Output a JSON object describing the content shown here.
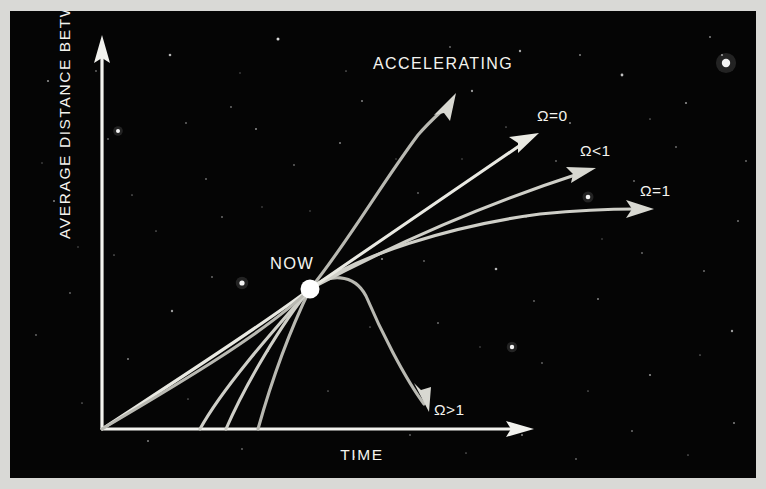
{
  "figure": {
    "alt_title": "Average Distance Between Galaxies versus Time",
    "background_color": "#050505",
    "border_color": "#d9d9d6",
    "ink_color": "#f2f2ee"
  },
  "axes": {
    "y_label": "AVERAGE DISTANCE BETWEEN GALAXIES",
    "x_label": "TIME",
    "y_arrow_direction": "up",
    "x_arrow_direction": "right",
    "ticks": [],
    "grid": false
  },
  "markers": {
    "now_label": "NOW",
    "now_point": [
      300,
      278
    ]
  },
  "labels": {
    "accelerating": "ACCELERATING",
    "omega_zero": "Ω=0",
    "omega_less_than_one": "Ω<1",
    "omega_equal_one": "Ω=1",
    "omega_greater_than_one": "Ω>1"
  },
  "chart_data": {
    "type": "line",
    "xlabel": "TIME",
    "ylabel": "AVERAGE DISTANCE BETWEEN GALAXIES",
    "xlim": [
      0,
      520
    ],
    "ylim": [
      0,
      420
    ],
    "grid": false,
    "legend_position": "inline-end-of-curve",
    "annotations": [
      {
        "text": "NOW",
        "x": 300,
        "y": 278,
        "marker": "filled-circle"
      },
      {
        "text": "ACCELERATING",
        "x": 433,
        "y": 62
      }
    ],
    "series": [
      {
        "name": "ACCELERATING",
        "label": "ACCELERATING",
        "style": "curve-up-concave",
        "start": [
          92,
          418
        ],
        "end": [
          443,
          88
        ],
        "points": [
          [
            92,
            418
          ],
          [
            180,
            370
          ],
          [
            250,
            322
          ],
          [
            300,
            278
          ],
          [
            340,
            215
          ],
          [
            375,
            160
          ],
          [
            412,
            118
          ],
          [
            443,
            88
          ]
        ],
        "arrow": true,
        "description": "Accelerating expansion: distance grows ever faster after NOW"
      },
      {
        "name": "omega_zero",
        "label": "Ω=0",
        "style": "straight-after-now",
        "start": [
          92,
          418
        ],
        "end": [
          527,
          124
        ],
        "points": [
          [
            92,
            418
          ],
          [
            180,
            360
          ],
          [
            250,
            315
          ],
          [
            300,
            278
          ],
          [
            380,
            222
          ],
          [
            460,
            168
          ],
          [
            527,
            124
          ]
        ],
        "arrow": true,
        "description": "Empty universe, coasting expansion, constant rate"
      },
      {
        "name": "omega_less_than_one",
        "label": "Ω<1",
        "style": "open-universe",
        "start": [
          190,
          418
        ],
        "end": [
          585,
          159
        ],
        "points": [
          [
            190,
            418
          ],
          [
            235,
            362
          ],
          [
            270,
            318
          ],
          [
            300,
            278
          ],
          [
            380,
            233
          ],
          [
            480,
            191
          ],
          [
            585,
            159
          ]
        ],
        "arrow": true,
        "description": "Open universe, expands forever at slowly decreasing rate"
      },
      {
        "name": "omega_equal_one",
        "label": "Ω=1",
        "style": "flat-universe",
        "start": [
          216,
          418
        ],
        "end": [
          641,
          198
        ],
        "points": [
          [
            216,
            418
          ],
          [
            250,
            360
          ],
          [
            278,
            315
          ],
          [
            300,
            278
          ],
          [
            370,
            243
          ],
          [
            470,
            217
          ],
          [
            560,
            204
          ],
          [
            641,
            198
          ]
        ],
        "arrow": true,
        "description": "Critical density, flat universe, expansion slows toward zero"
      },
      {
        "name": "omega_greater_than_one",
        "label": "Ω>1",
        "style": "closed-universe",
        "start": [
          248,
          418
        ],
        "end": [
          418,
          397
        ],
        "points": [
          [
            248,
            418
          ],
          [
            268,
            355
          ],
          [
            285,
            310
          ],
          [
            300,
            278
          ],
          [
            332,
            268
          ],
          [
            356,
            283
          ],
          [
            380,
            322
          ],
          [
            402,
            365
          ],
          [
            418,
            397
          ]
        ],
        "arrow": true,
        "description": "Closed universe, expansion halts and recollapses"
      }
    ]
  },
  "stars": [
    [
      38,
      70,
      1.1,
      0.55
    ],
    [
      98,
      128,
      0.9,
      0.4
    ],
    [
      160,
      44,
      1.3,
      0.7
    ],
    [
      221,
      96,
      0.9,
      0.45
    ],
    [
      268,
      28,
      1.5,
      0.85
    ],
    [
      330,
      132,
      1.0,
      0.5
    ],
    [
      392,
      56,
      1.1,
      0.6
    ],
    [
      452,
      148,
      0.8,
      0.35
    ],
    [
      510,
      40,
      1.2,
      0.65
    ],
    [
      560,
      112,
      1.0,
      0.5
    ],
    [
      612,
      64,
      1.4,
      0.75
    ],
    [
      666,
      136,
      0.9,
      0.45
    ],
    [
      712,
      44,
      1.1,
      0.55
    ],
    [
      44,
      190,
      1.0,
      0.5
    ],
    [
      104,
      244,
      0.85,
      0.4
    ],
    [
      162,
      300,
      1.2,
      0.6
    ],
    [
      212,
      206,
      0.9,
      0.45
    ],
    [
      258,
      340,
      1.0,
      0.5
    ],
    [
      318,
      380,
      0.85,
      0.4
    ],
    [
      372,
      248,
      1.1,
      0.55
    ],
    [
      428,
      312,
      0.95,
      0.45
    ],
    [
      486,
      258,
      1.3,
      0.7
    ],
    [
      532,
      352,
      0.9,
      0.4
    ],
    [
      588,
      288,
      1.0,
      0.5
    ],
    [
      640,
      364,
      1.1,
      0.55
    ],
    [
      694,
      260,
      0.95,
      0.45
    ],
    [
      722,
      320,
      1.2,
      0.6
    ],
    [
      72,
      392,
      0.85,
      0.4
    ],
    [
      138,
      430,
      1.0,
      0.5
    ],
    [
      196,
      168,
      0.9,
      0.45
    ],
    [
      246,
      118,
      1.05,
      0.52
    ],
    [
      300,
      200,
      0.8,
      0.35
    ],
    [
      352,
      90,
      1.0,
      0.5
    ],
    [
      408,
      182,
      0.9,
      0.42
    ],
    [
      462,
      80,
      1.15,
      0.6
    ],
    [
      516,
      206,
      0.85,
      0.4
    ],
    [
      570,
      44,
      1.0,
      0.5
    ],
    [
      624,
      170,
      0.9,
      0.45
    ],
    [
      676,
      92,
      1.1,
      0.55
    ],
    [
      728,
      210,
      0.95,
      0.48
    ],
    [
      60,
      282,
      0.9,
      0.42
    ],
    [
      118,
      348,
      1.0,
      0.5
    ],
    [
      178,
      388,
      0.85,
      0.38
    ],
    [
      232,
      438,
      0.9,
      0.42
    ],
    [
      290,
      418,
      0.8,
      0.35
    ],
    [
      344,
      446,
      1.0,
      0.48
    ],
    [
      400,
      424,
      0.9,
      0.4
    ],
    [
      456,
      442,
      0.85,
      0.38
    ],
    [
      512,
      424,
      1.0,
      0.5
    ],
    [
      566,
      448,
      0.9,
      0.42
    ],
    [
      622,
      420,
      0.95,
      0.45
    ],
    [
      678,
      444,
      0.85,
      0.38
    ],
    [
      724,
      412,
      1.0,
      0.5
    ],
    [
      32,
      152,
      0.8,
      0.35
    ],
    [
      86,
      60,
      0.9,
      0.42
    ],
    [
      146,
      220,
      0.85,
      0.4
    ],
    [
      202,
      266,
      0.9,
      0.44
    ],
    [
      252,
      196,
      0.8,
      0.35
    ],
    [
      360,
      316,
      0.85,
      0.38
    ],
    [
      414,
      250,
      0.9,
      0.42
    ],
    [
      470,
      336,
      0.8,
      0.35
    ],
    [
      524,
      290,
      0.9,
      0.42
    ],
    [
      578,
      380,
      0.85,
      0.38
    ],
    [
      632,
      242,
      0.9,
      0.44
    ],
    [
      690,
      344,
      0.85,
      0.4
    ],
    [
      736,
      150,
      0.9,
      0.45
    ],
    [
      700,
      26,
      1.0,
      0.5
    ],
    [
      640,
      108,
      0.85,
      0.4
    ],
    [
      592,
      228,
      0.8,
      0.35
    ],
    [
      546,
      150,
      0.9,
      0.42
    ],
    [
      496,
      116,
      0.85,
      0.38
    ],
    [
      440,
      36,
      0.9,
      0.45
    ],
    [
      386,
      148,
      0.8,
      0.35
    ],
    [
      336,
      60,
      0.85,
      0.4
    ],
    [
      284,
      154,
      0.9,
      0.42
    ],
    [
      230,
      62,
      0.8,
      0.35
    ],
    [
      176,
      112,
      0.9,
      0.44
    ],
    [
      122,
      184,
      0.85,
      0.4
    ],
    [
      68,
      236,
      0.8,
      0.35
    ],
    [
      26,
      324,
      0.9,
      0.42
    ]
  ],
  "bright_stars": [
    [
      716,
      52,
      4.2
    ],
    [
      232,
      272,
      2.6
    ],
    [
      502,
      336,
      2.2
    ],
    [
      108,
      120,
      2.0
    ],
    [
      578,
      186,
      2.3
    ]
  ]
}
